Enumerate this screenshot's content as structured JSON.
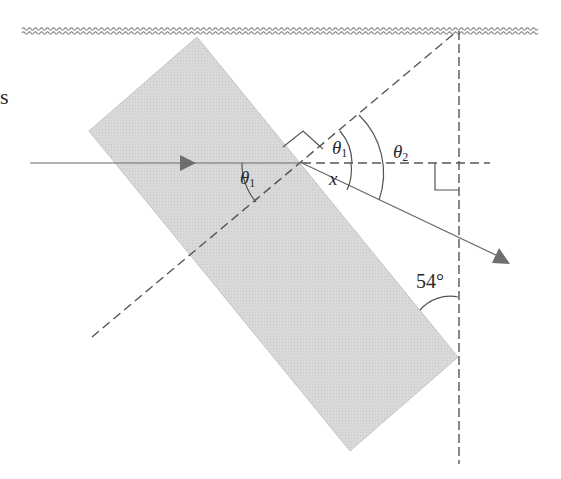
{
  "diagram": {
    "colors": {
      "slab_fill": "#d6d6d6",
      "slab_edge": "#bdbdbd",
      "line": "#555555",
      "ray": "#6a6a6a",
      "arrow": "#6e6e6e",
      "ceiling": "#8a8a8a",
      "text": "#2a2a2a"
    },
    "labels": {
      "edge_fragment": "s",
      "theta1_inside": {
        "symbol": "θ",
        "sub": "1"
      },
      "theta1_outside": {
        "symbol": "θ",
        "sub": "1"
      },
      "theta2": {
        "symbol": "θ",
        "sub": "2"
      },
      "x": "x",
      "angle_54": "54°"
    },
    "elements": {
      "ceiling": "wavy ceiling line",
      "slab": "rotated rectangular glass slab",
      "incident_ray": "horizontal incident ray with arrowhead",
      "refracted_ray": "refracted ray exiting lower right with arrowhead",
      "normal_line": "dashed normal line through point of incidence",
      "horizontal_extension": "dashed horizontal extension of incident ray",
      "vertical_line": "dashed vertical line from ceiling",
      "right_angle_markers": 2
    }
  }
}
